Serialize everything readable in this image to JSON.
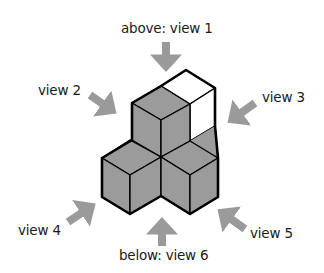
{
  "diagram": {
    "colors": {
      "cube_fill": "#9b9b9b",
      "cube_white": "#ffffff",
      "edge": "#000000",
      "arrow": "#9a9a9a",
      "text": "#1a1a1a"
    },
    "labels": {
      "view1": "above: view 1",
      "view2": "view 2",
      "view3": "view 3",
      "view4": "view 4",
      "view5": "view 5",
      "view6": "below: view 6"
    },
    "cubes": [
      {
        "name": "top-stacked-cube",
        "fill": "gray"
      },
      {
        "name": "back-white-cube",
        "fill": "white"
      },
      {
        "name": "front-left-cube",
        "fill": "gray"
      },
      {
        "name": "front-right-cube",
        "fill": "gray"
      }
    ],
    "arrows": [
      {
        "name": "view1",
        "direction": "down"
      },
      {
        "name": "view2",
        "direction": "down-right"
      },
      {
        "name": "view3",
        "direction": "down-left"
      },
      {
        "name": "view4",
        "direction": "up-right"
      },
      {
        "name": "view5",
        "direction": "up-left"
      },
      {
        "name": "view6",
        "direction": "up"
      }
    ]
  }
}
